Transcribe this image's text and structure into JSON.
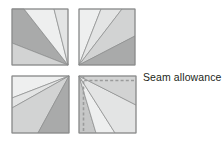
{
  "figure": {
    "canvas": {
      "width": 224,
      "height": 141,
      "background": "#ffffff"
    }
  },
  "annotations": {
    "seam_allowance_label": "Seam allowance"
  },
  "palette": {
    "lightest": "#eeefef",
    "light": "#e3e4e4",
    "medium_light": "#d2d3d3",
    "medium": "#c6c7c7",
    "dark": "#a9aaaa",
    "outline": "#8a8b8b",
    "wedge_line": "#8a8b8b",
    "dashed_seam": "#9a9b9b",
    "text": "#231f20"
  },
  "blocks": [
    {
      "id": "top-left",
      "name": "top-left-block",
      "x": 12,
      "y": 9,
      "size": 56,
      "apex": "bottom-right",
      "wedges": [
        {
          "shade": "light",
          "points": "0,0 12,0 56,56"
        },
        {
          "shade": "dark",
          "points": "12,0 0,0 0,34 56,56"
        },
        {
          "shade": "medium_light",
          "points": "0,34 0,56 56,56"
        },
        {
          "shade": "lightest",
          "points": "12,0 42,0 56,56"
        },
        {
          "shade": "light",
          "points": "42,0 56,0 56,56"
        }
      ]
    },
    {
      "id": "top-right",
      "name": "top-right-block",
      "x": 79,
      "y": 9,
      "size": 56,
      "apex": "bottom-left",
      "wedges": [
        {
          "shade": "lightest",
          "points": "0,0 22,0 0,56"
        },
        {
          "shade": "light",
          "points": "22,0 43,0 0,56"
        },
        {
          "shade": "medium_light",
          "points": "43,0 56,0 56,27 0,56"
        },
        {
          "shade": "dark",
          "points": "56,27 56,56 0,56"
        }
      ]
    },
    {
      "id": "bottom-left",
      "name": "bottom-left-block",
      "x": 12,
      "y": 76,
      "size": 57,
      "apex": "top-right",
      "wedges": [
        {
          "shade": "lightest",
          "points": "57,0 0,0 0,22"
        },
        {
          "shade": "light",
          "points": "57,0 0,22 0,32"
        },
        {
          "shade": "medium_light",
          "points": "57,0 0,32 0,57 26,57"
        },
        {
          "shade": "dark",
          "points": "57,0 26,57 57,57"
        }
      ]
    },
    {
      "id": "bottom-right",
      "name": "bottom-right-block",
      "x": 79,
      "y": 76,
      "size": 57,
      "apex": "top-left",
      "seam_allowance_edges": [
        "top",
        "left"
      ],
      "wedges": [
        {
          "shade": "medium",
          "points": "0,0 0,57 17,57"
        },
        {
          "shade": "lightest",
          "points": "0,0 17,57 36,57"
        },
        {
          "shade": "light",
          "points": "0,0 36,57 57,57 57,29"
        },
        {
          "shade": "medium_light",
          "points": "0,0 57,29 57,0"
        }
      ]
    }
  ]
}
